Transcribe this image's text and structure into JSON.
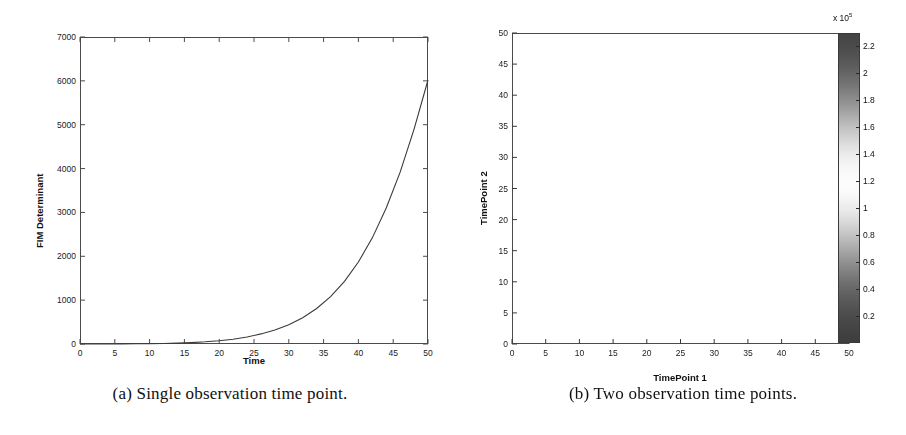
{
  "figure": {
    "panel_a": {
      "caption": "(a) Single observation time point.",
      "chart_data": {
        "type": "line",
        "title": "",
        "xlabel": "Time",
        "ylabel": "FIM Determinant",
        "xlim": [
          0,
          50
        ],
        "ylim": [
          0,
          7000
        ],
        "xticks": [
          0,
          5,
          10,
          15,
          20,
          25,
          30,
          35,
          40,
          45,
          50
        ],
        "yticks": [
          0,
          1000,
          2000,
          3000,
          4000,
          5000,
          6000,
          7000
        ],
        "grid": false,
        "legend": "none",
        "series": [
          {
            "name": "FIM Determinant",
            "color": "#3a3a3a",
            "x": [
              0,
              2,
              4,
              6,
              8,
              10,
              12,
              14,
              16,
              18,
              20,
              22,
              24,
              26,
              28,
              30,
              32,
              34,
              36,
              38,
              40,
              42,
              44,
              46,
              48,
              50
            ],
            "values": [
              0,
              0,
              1,
              2,
              4,
              7,
              12,
              20,
              32,
              50,
              75,
              110,
              160,
              230,
              320,
              440,
              600,
              810,
              1080,
              1430,
              1870,
              2420,
              3100,
              3920,
              4900,
              6020
            ]
          }
        ]
      }
    },
    "panel_b": {
      "caption": "(b) Two observation time points.",
      "chart_data": {
        "type": "heatmap",
        "title": "",
        "xlabel": "TimePoint 1",
        "ylabel": "TimePoint 2",
        "xlim": [
          0,
          50
        ],
        "ylim": [
          0,
          50
        ],
        "xticks": [
          0,
          5,
          10,
          15,
          20,
          25,
          30,
          35,
          40,
          45,
          50
        ],
        "yticks": [
          0,
          5,
          10,
          15,
          20,
          25,
          30,
          35,
          40,
          45,
          50
        ],
        "grid": true,
        "grid_note": "fine mesh overlay on every cell",
        "colorbar": {
          "exponent_label": "x 10",
          "exponent_power": "5",
          "ticks": [
            0.2,
            0.4,
            0.6,
            0.8,
            1,
            1.2,
            1.4,
            1.6,
            1.8,
            2,
            2.2
          ],
          "tick_labels": [
            "0.2",
            "0.4",
            "0.6",
            "0.8",
            "1",
            "1.2",
            "1.4",
            "1.6",
            "1.8",
            "2",
            "2.2"
          ],
          "vmin": 0,
          "vmax": 2.3,
          "orientation": "vertical",
          "position": "right",
          "colormap": "inverted-gray (low = dark, mid = light, high = dark)"
        },
        "data_description": "FIM determinant surface over two observation time points; bright (high-value) ridge runs from upper-left area across to lower-right near TimePoint1 = 45-48, darkest regions at top-right and bottom-left corners",
        "z_range": [
          0,
          230000
        ]
      }
    }
  }
}
